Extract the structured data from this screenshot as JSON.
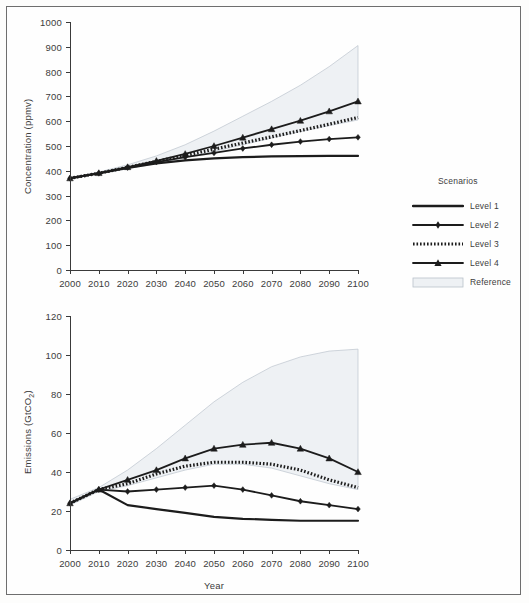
{
  "figure": {
    "xlabel": "Year"
  },
  "legend": {
    "title": "Scenarios",
    "items": [
      {
        "label": "Level 1",
        "key": "solid-thick"
      },
      {
        "label": "Level 2",
        "key": "solid-diamond"
      },
      {
        "label": "Level 3",
        "key": "dotted-thick"
      },
      {
        "label": "Level 4",
        "key": "solid-triangle"
      },
      {
        "label": "Reference",
        "key": "shaded-band"
      }
    ]
  },
  "colors": {
    "line": "#1c1c1c",
    "band_fill": "#eef1f4",
    "band_edge": "#b9c2cb",
    "axis": "#3a3a3a",
    "text": "#3c3c3c"
  },
  "chart_data": [
    {
      "type": "line",
      "id": "concentration",
      "title": "",
      "xlabel": "",
      "ylabel": "Concentration (ppmv)",
      "x": [
        2000,
        2010,
        2020,
        2030,
        2040,
        2050,
        2060,
        2070,
        2080,
        2090,
        2100
      ],
      "xlim": [
        2000,
        2100
      ],
      "ylim": [
        0,
        1000
      ],
      "yticks": [
        0,
        100,
        200,
        300,
        400,
        500,
        600,
        700,
        800,
        900,
        1000
      ],
      "xticks": [
        2000,
        2010,
        2020,
        2030,
        2040,
        2050,
        2060,
        2070,
        2080,
        2090,
        2100
      ],
      "grid": false,
      "legend_position": "right",
      "series": [
        {
          "name": "Level 1",
          "marker": "none",
          "style": "solid",
          "values": [
            370,
            390,
            412,
            430,
            442,
            450,
            455,
            458,
            459,
            460,
            460
          ]
        },
        {
          "name": "Level 2",
          "marker": "diamond",
          "style": "solid",
          "values": [
            370,
            390,
            413,
            435,
            455,
            472,
            490,
            505,
            518,
            528,
            535
          ]
        },
        {
          "name": "Level 3",
          "marker": "none",
          "style": "dotted",
          "values": [
            370,
            390,
            414,
            438,
            462,
            487,
            512,
            537,
            562,
            588,
            615
          ]
        },
        {
          "name": "Level 4",
          "marker": "triangle",
          "style": "solid",
          "values": [
            370,
            391,
            415,
            440,
            468,
            500,
            534,
            568,
            602,
            640,
            680
          ]
        }
      ],
      "band": {
        "name": "Reference",
        "upper": [
          372,
          395,
          424,
          460,
          505,
          560,
          620,
          680,
          745,
          820,
          905
        ],
        "lower": [
          368,
          388,
          408,
          430,
          452,
          478,
          505,
          532,
          558,
          582,
          605
        ]
      }
    },
    {
      "type": "line",
      "id": "emissions",
      "title": "",
      "xlabel": "Year",
      "ylabel": "Emissions (GtCO2)",
      "x": [
        2000,
        2010,
        2020,
        2030,
        2040,
        2050,
        2060,
        2070,
        2080,
        2090,
        2100
      ],
      "xlim": [
        2000,
        2100
      ],
      "ylim": [
        0,
        120
      ],
      "yticks": [
        0,
        20,
        40,
        60,
        80,
        100,
        120
      ],
      "xticks": [
        2000,
        2010,
        2020,
        2030,
        2040,
        2050,
        2060,
        2070,
        2080,
        2090,
        2100
      ],
      "grid": false,
      "legend_position": "right",
      "series": [
        {
          "name": "Level 1",
          "marker": "none",
          "style": "solid",
          "values": [
            24,
            31,
            23,
            21,
            19,
            17,
            16,
            15.5,
            15,
            15,
            15
          ]
        },
        {
          "name": "Level 2",
          "marker": "diamond",
          "style": "solid",
          "values": [
            24,
            31,
            30,
            31,
            32,
            33,
            31,
            28,
            25,
            23,
            21
          ]
        },
        {
          "name": "Level 3",
          "marker": "none",
          "style": "dotted",
          "values": [
            24,
            31,
            34,
            39,
            43,
            45,
            45,
            44,
            41,
            36,
            32
          ]
        },
        {
          "name": "Level 4",
          "marker": "triangle",
          "style": "solid",
          "values": [
            24,
            31,
            36,
            41,
            47,
            52,
            54,
            55,
            52,
            47,
            40
          ]
        }
      ],
      "band": {
        "name": "Reference",
        "upper": [
          26,
          32,
          41,
          52,
          64,
          76,
          86,
          94,
          99,
          102,
          103
        ],
        "lower": [
          23,
          30,
          33,
          37,
          41,
          44,
          44,
          42,
          38,
          34,
          31
        ]
      }
    }
  ]
}
